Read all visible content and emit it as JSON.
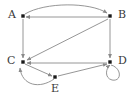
{
  "figure": {
    "type": "directed-graph",
    "width": 133,
    "height": 97,
    "background_color": "#ffffff",
    "edge_color": "#8a8a8a",
    "node_color": "#1a1a1a",
    "label_color": "#3a3a3a"
  },
  "nodes": [
    {
      "id": "A",
      "label": "A",
      "x": 23,
      "y": 16,
      "label_x": 8,
      "label_y": 9
    },
    {
      "id": "B",
      "label": "B",
      "x": 110,
      "y": 16,
      "label_x": 118,
      "label_y": 9
    },
    {
      "id": "C",
      "label": "C",
      "x": 23,
      "y": 62,
      "label_x": 7,
      "label_y": 55
    },
    {
      "id": "D",
      "label": "D",
      "x": 110,
      "y": 62,
      "label_x": 118,
      "label_y": 55
    },
    {
      "id": "E",
      "label": "E",
      "x": 55,
      "y": 77,
      "label_x": 51,
      "label_y": 83
    }
  ],
  "edges": [
    {
      "from": "A",
      "to": "B",
      "shape": "curve-up",
      "path": "M 25,14 C 45,2 90,2 107,13"
    },
    {
      "from": "B",
      "to": "A",
      "shape": "straight",
      "path": "M 108,17 L 26,17"
    },
    {
      "from": "A",
      "to": "C",
      "shape": "straight",
      "path": "M 23,19 L 23,58"
    },
    {
      "from": "B",
      "to": "D",
      "shape": "straight",
      "path": "M 110,19 L 110,58"
    },
    {
      "from": "B",
      "to": "C",
      "shape": "straight",
      "path": "M 108,19 L 27,60"
    },
    {
      "from": "D",
      "to": "C",
      "shape": "straight",
      "path": "M 107,63 L 27,63"
    },
    {
      "from": "C",
      "to": "E",
      "shape": "straight",
      "path": "M 25,64 L 52,76"
    },
    {
      "from": "E",
      "to": "C",
      "shape": "curve-below",
      "path": "M 54,79 C 40,89 22,86 20,68"
    },
    {
      "from": "E",
      "to": "D",
      "shape": "straight",
      "path": "M 58,76 L 107,64"
    },
    {
      "from": "D",
      "to": "D",
      "shape": "self-loop",
      "path": "M 111,65 C 122,68 122,82 112,80 C 104,78 106,68 110,65"
    }
  ],
  "edge_count": 10,
  "node_count": 5
}
